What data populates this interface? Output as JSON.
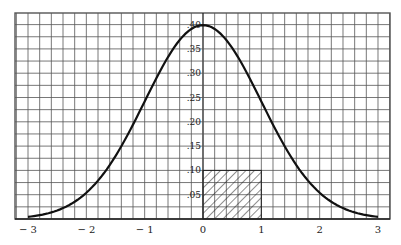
{
  "chart_data": {
    "type": "line",
    "title": "",
    "xlabel": "",
    "ylabel": "",
    "xlim": [
      -3,
      3
    ],
    "ylim": [
      0,
      0.4
    ],
    "grid": true,
    "x_ticks": [
      -3,
      -2,
      -1,
      0,
      1,
      2,
      3
    ],
    "x_tick_labels": [
      "− 3",
      "− 2",
      "− 1",
      "0",
      "1",
      "2",
      "3"
    ],
    "y_ticks": [
      0.05,
      0.1,
      0.15,
      0.2,
      0.25,
      0.3,
      0.35,
      0.4
    ],
    "y_tick_labels": [
      ".05",
      ".10",
      ".15",
      ".20",
      ".25",
      ".30",
      ".35",
      ".40"
    ],
    "series": [
      {
        "name": "normal-density",
        "x": [
          -3.0,
          -2.5,
          -2.0,
          -1.5,
          -1.0,
          -0.5,
          0.0,
          0.5,
          1.0,
          1.5,
          2.0,
          2.5,
          3.0
        ],
        "y": [
          0.0044,
          0.0175,
          0.054,
          0.1295,
          0.242,
          0.3521,
          0.3989,
          0.3521,
          0.242,
          0.1295,
          0.054,
          0.0175,
          0.0044
        ]
      }
    ],
    "annotations": [
      {
        "type": "hatched-rectangle",
        "x0": 0,
        "x1": 1,
        "y0": 0,
        "y1": 0.1
      }
    ],
    "colors": {
      "grid": "#555555",
      "curve": "#111111",
      "text": "#222222",
      "background": "#ffffff"
    }
  }
}
